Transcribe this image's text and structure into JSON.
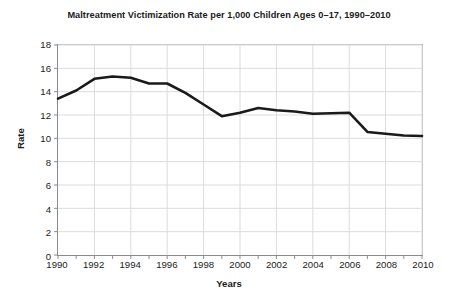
{
  "chart_data": {
    "type": "line",
    "title": "Maltreatment Victimization Rate per 1,000 Children Ages 0–17, 1990–2010",
    "xlabel": "Years",
    "ylabel": "Rate",
    "x": [
      1990,
      1991,
      1992,
      1993,
      1994,
      1995,
      1996,
      1997,
      1998,
      1999,
      2000,
      2001,
      2002,
      2003,
      2004,
      2005,
      2006,
      2007,
      2008,
      2009,
      2010
    ],
    "values": [
      13.4,
      14.1,
      15.1,
      15.3,
      15.2,
      14.7,
      14.7,
      13.9,
      12.9,
      11.9,
      12.2,
      12.6,
      12.4,
      12.3,
      12.1,
      12.15,
      12.2,
      10.55,
      10.4,
      10.25,
      10.2
    ],
    "series": [
      {
        "name": "Maltreatment victimization rate",
        "values": [
          13.4,
          14.1,
          15.1,
          15.3,
          15.2,
          14.7,
          14.7,
          13.9,
          12.9,
          11.9,
          12.2,
          12.6,
          12.4,
          12.3,
          12.1,
          12.15,
          12.2,
          10.55,
          10.4,
          10.25,
          10.2
        ],
        "color": "#1a1a1a"
      }
    ],
    "xlim": [
      1990,
      2010
    ],
    "ylim": [
      0,
      18
    ],
    "ytick_step": 2,
    "yticks": [
      0,
      2,
      4,
      6,
      8,
      10,
      12,
      14,
      16,
      18
    ],
    "ytick_labels": [
      "0",
      "2",
      "4",
      "6",
      "8",
      "10",
      "12",
      "14",
      "16",
      "18"
    ],
    "xticks": [
      1990,
      1991,
      1992,
      1993,
      1994,
      1995,
      1996,
      1997,
      1998,
      1999,
      2000,
      2001,
      2002,
      2003,
      2004,
      2005,
      2006,
      2007,
      2008,
      2009,
      2010
    ],
    "xtick_labels_shown": [
      "1990",
      "1992",
      "1994",
      "1996",
      "1998",
      "2000",
      "2002",
      "2004",
      "2006",
      "2008",
      "2010"
    ],
    "xtick_label_step": 2,
    "grid": true,
    "grid_color": "#dcdcdc",
    "legend": false,
    "legend_position": "none",
    "background_color": "#ffffff",
    "axis_color": "#8a8a8a"
  }
}
